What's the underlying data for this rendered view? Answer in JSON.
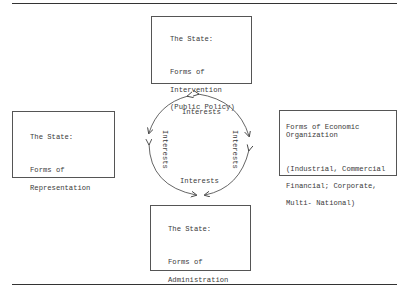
{
  "boxes": {
    "top": {
      "heading": "The State:",
      "lines": [
        "Forms of",
        "Intervention",
        "(Public Policy)"
      ]
    },
    "left": {
      "heading": "The State:",
      "lines": [
        "Forms of",
        "Representation"
      ]
    },
    "right": {
      "heading": "Forms of Economic\nOrganization",
      "lines": [
        "(Industrial, Commercial",
        "Financial; Corporate,",
        "Multi- National)"
      ]
    },
    "bottom": {
      "heading": "The State:",
      "lines": [
        "Forms of",
        "Administration"
      ]
    }
  },
  "cycle": {
    "labels": {
      "top": "Interests",
      "left": "Interests",
      "right": "Interests",
      "bottom": "Interests"
    },
    "arrows": "bidirectional arcs forming a circle connecting top, left, right and bottom nodes"
  }
}
